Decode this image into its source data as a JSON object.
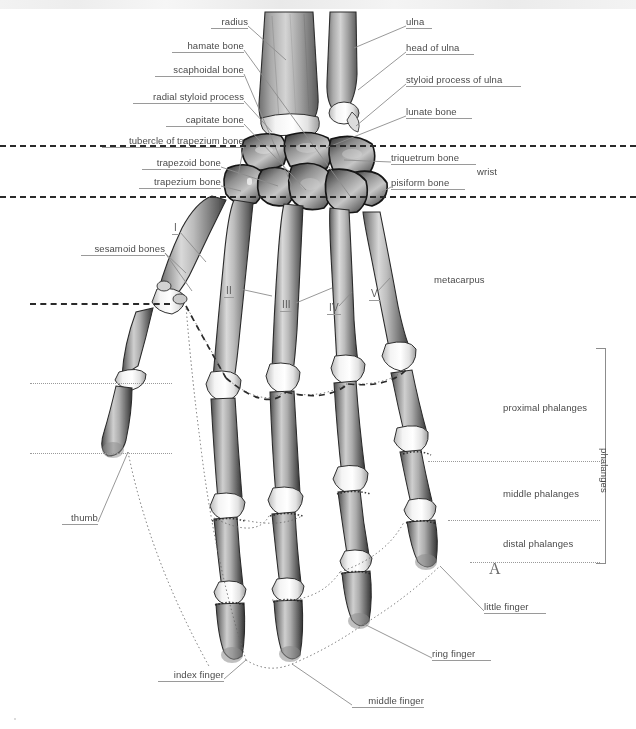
{
  "figure": {
    "panel_letter": "A",
    "ink_color": "#4a4a4a",
    "leader_color": "#8c8c8c",
    "divider_color": "#2a2a2a"
  },
  "labels_left": [
    {
      "id": "radius",
      "text": "radius",
      "x": 211,
      "y": 16,
      "w": 37
    },
    {
      "id": "hamate-bone",
      "text": "hamate bone",
      "x": 172,
      "y": 40,
      "w": 72
    },
    {
      "id": "scaphoidal-bone",
      "text": "scaphoidal bone",
      "x": 155,
      "y": 64,
      "w": 89
    },
    {
      "id": "radial-styloid-process",
      "text": "radial styloid process",
      "x": 133,
      "y": 91,
      "w": 111
    },
    {
      "id": "capitate-bone",
      "text": "capitate bone",
      "x": 166,
      "y": 114,
      "w": 78
    },
    {
      "id": "tubercle-of-trapezium",
      "text": "tubercle of trapezium bone",
      "x": 102,
      "y": 135,
      "w": 142
    },
    {
      "id": "trapezoid-bone",
      "text": "trapezoid bone",
      "x": 142,
      "y": 157,
      "w": 79
    },
    {
      "id": "trapezium-bone",
      "text": "trapezium bone",
      "x": 139,
      "y": 176,
      "w": 82
    },
    {
      "id": "sesamoid-bones",
      "text": "sesamoid bones",
      "x": 81,
      "y": 243,
      "w": 84
    },
    {
      "id": "thumb",
      "text": "thumb",
      "x": 62,
      "y": 512,
      "w": 36
    },
    {
      "id": "index-finger",
      "text": "index finger",
      "x": 158,
      "y": 669,
      "w": 66
    },
    {
      "id": "middle-finger",
      "text": "middle finger",
      "x": 352,
      "y": 695,
      "w": 72
    }
  ],
  "labels_right": [
    {
      "id": "ulna",
      "text": "ulna",
      "x": 406,
      "y": 16,
      "w": 26
    },
    {
      "id": "head-of-ulna",
      "text": "head of ulna",
      "x": 406,
      "y": 42,
      "w": 68
    },
    {
      "id": "styloid-process-of-ulna",
      "text": "styloid process of ulna",
      "x": 406,
      "y": 74,
      "w": 115
    },
    {
      "id": "lunate-bone",
      "text": "lunate bone",
      "x": 406,
      "y": 106,
      "w": 66
    },
    {
      "id": "triquetrum-bone",
      "text": "triquetrum bone",
      "x": 391,
      "y": 152,
      "w": 85
    },
    {
      "id": "pisiform-bone",
      "text": "pisiform bone",
      "x": 391,
      "y": 177,
      "w": 74
    },
    {
      "id": "ring-finger",
      "text": "ring finger",
      "x": 432,
      "y": 648,
      "w": 59
    },
    {
      "id": "little-finger",
      "text": "little finger",
      "x": 484,
      "y": 601,
      "w": 62
    }
  ],
  "region_labels": [
    {
      "id": "wrist",
      "text": "wrist",
      "x": 477,
      "y": 166
    },
    {
      "id": "metacarpus",
      "text": "metacarpus",
      "x": 434,
      "y": 274
    },
    {
      "id": "proximal-phalanges",
      "text": "proximal phalanges",
      "x": 503,
      "y": 402
    },
    {
      "id": "middle-phalanges",
      "text": "middle phalanges",
      "x": 503,
      "y": 488
    },
    {
      "id": "distal-phalanges",
      "text": "distal phalanges",
      "x": 503,
      "y": 538
    },
    {
      "id": "phalanges-bracket",
      "text": "phalanges",
      "x": 610,
      "y": 448
    }
  ],
  "metacarpal_numerals": [
    {
      "id": "metacarpal-I",
      "text": "I",
      "x": 172,
      "y": 222
    },
    {
      "id": "metacarpal-II",
      "text": "II",
      "x": 224,
      "y": 285
    },
    {
      "id": "metacarpal-III",
      "text": "III",
      "x": 280,
      "y": 299
    },
    {
      "id": "metacarpal-IV",
      "text": "IV",
      "x": 327,
      "y": 302
    },
    {
      "id": "metacarpal-V",
      "text": "V",
      "x": 369,
      "y": 288
    }
  ],
  "dividers": {
    "wrist_top": {
      "y": 145,
      "x1": 0,
      "x2": 636
    },
    "wrist_bottom": {
      "y": 196,
      "x1": 0,
      "x2": 636
    },
    "thumb_mcp": {
      "y": 303,
      "x1": 30,
      "x2": 170
    },
    "thumb_prox": {
      "y": 383,
      "x1": 30,
      "x2": 170
    },
    "thumb_dist": {
      "y": 453,
      "x1": 30,
      "x2": 170
    },
    "proximal_mid": {
      "y": 461,
      "x1": 470,
      "x2": 600
    },
    "mid_distal": {
      "y": 520,
      "x1": 470,
      "x2": 600
    },
    "distal_end": {
      "y": 562,
      "x1": 470,
      "x2": 600
    }
  },
  "bracket": {
    "x": 596,
    "y": 348,
    "w": 10,
    "h": 214
  }
}
